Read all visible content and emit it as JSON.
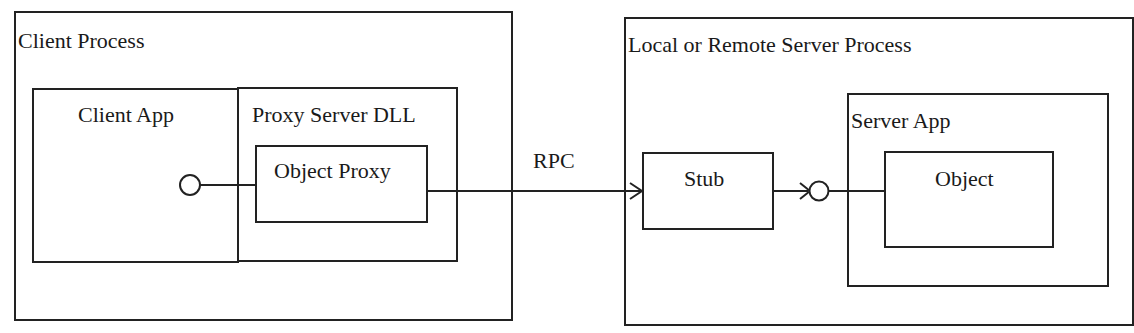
{
  "diagram": {
    "client_process": {
      "label": "Client Process"
    },
    "client_app": {
      "label": "Client App"
    },
    "proxy_server_dll": {
      "label": "Proxy Server DLL"
    },
    "object_proxy": {
      "label": "Object Proxy"
    },
    "connection": {
      "label": "RPC"
    },
    "server_process": {
      "label": "Local or Remote Server Process"
    },
    "stub": {
      "label": "Stub"
    },
    "server_app": {
      "label": "Server App"
    },
    "object": {
      "label": "Object"
    }
  },
  "colors": {
    "line": "#222222",
    "background": "#ffffff",
    "text": "#1a1a1a"
  }
}
